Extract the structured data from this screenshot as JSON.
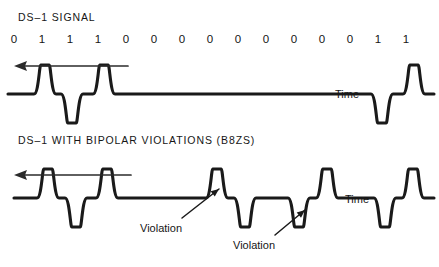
{
  "figure": {
    "kind": "waveform-diagram",
    "background_color": "#ffffff",
    "line_color": "#1a1a1a",
    "text_color": "#161616"
  },
  "top_panel": {
    "title": "DS–1 SIGNAL",
    "time_label": "Time",
    "direction_arrow": "leftward-time-arrow",
    "bits": [
      "0",
      "1",
      "1",
      "1",
      "0",
      "0",
      "0",
      "0",
      "0",
      "0",
      "0",
      "0",
      "0",
      "1",
      "1"
    ],
    "bit_x": [
      14,
      42,
      70,
      98,
      126,
      154,
      182,
      210,
      238,
      266,
      294,
      322,
      350,
      378,
      406
    ],
    "baseline_y": 94,
    "pulse_amplitude": 29,
    "pulses": [
      {
        "bit_index": 1,
        "polarity": "positive",
        "center_x": 45
      },
      {
        "bit_index": 2,
        "polarity": "negative",
        "center_x": 72
      },
      {
        "bit_index": 3,
        "polarity": "positive",
        "center_x": 104
      },
      {
        "bit_index": 13,
        "polarity": "negative",
        "center_x": 382
      },
      {
        "bit_index": 14,
        "polarity": "positive",
        "center_x": 414
      }
    ]
  },
  "bottom_panel": {
    "title": "DS–1 WITH BIPOLAR VIOLATIONS (B8ZS)",
    "time_label": "Time",
    "direction_arrow": "leftward-time-arrow",
    "baseline_y": 198,
    "pulse_amplitude": 29,
    "pulses": [
      {
        "polarity": "positive",
        "center_x": 48
      },
      {
        "polarity": "negative",
        "center_x": 76
      },
      {
        "polarity": "positive",
        "center_x": 107
      },
      {
        "polarity": "positive",
        "center_x": 217,
        "violation": true
      },
      {
        "polarity": "negative",
        "center_x": 245
      },
      {
        "polarity": "negative",
        "center_x": 299,
        "violation": true
      },
      {
        "polarity": "positive",
        "center_x": 327
      },
      {
        "polarity": "negative",
        "center_x": 385
      },
      {
        "polarity": "positive",
        "center_x": 413
      }
    ],
    "annotations": [
      {
        "label": "Violation",
        "text_x": 140,
        "text_y": 222,
        "target_x": 219,
        "target_y": 189
      },
      {
        "label": "Violation",
        "text_x": 233,
        "text_y": 239,
        "target_x": 305,
        "target_y": 210
      }
    ]
  }
}
